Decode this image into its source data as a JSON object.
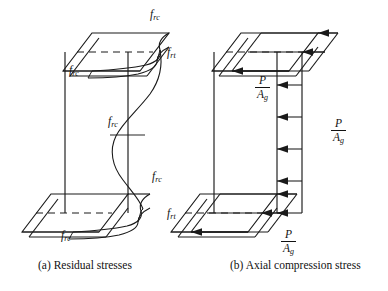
{
  "figure": {
    "background_color": "#ffffff",
    "ink_color": "#1a1a1a",
    "panels": [
      {
        "id": "a",
        "caption": "(a) Residual stresses",
        "caption_x": 38,
        "caption_y": 259,
        "description": "Isometric wide-flange I-section showing residual stress distribution with compression at flange tips and web center, tension at flange-web junctions",
        "labels": [
          {
            "name": "top-flange-tip-frc",
            "symbol": "f",
            "subscript": "rc",
            "x": 150,
            "y": 10
          },
          {
            "name": "top-flange-junction-frt",
            "symbol": "f",
            "subscript": "rt",
            "x": 167,
            "y": 48
          },
          {
            "name": "top-flange-inner-frc",
            "symbol": "f",
            "subscript": "rc",
            "x": 69,
            "y": 66
          },
          {
            "name": "web-mid-frc",
            "symbol": "f",
            "subscript": "rc",
            "x": 108,
            "y": 117
          },
          {
            "name": "bottom-flange-tip-frc",
            "symbol": "f",
            "subscript": "rc",
            "x": 152,
            "y": 172
          },
          {
            "name": "bottom-flange-junction-frt",
            "symbol": "f",
            "subscript": "rt",
            "x": 167,
            "y": 209
          },
          {
            "name": "bottom-flange-inner-frc",
            "symbol": "f",
            "subscript": "rc",
            "x": 61,
            "y": 231
          }
        ]
      },
      {
        "id": "b",
        "caption": "(b) Axial compression stress",
        "caption_x": 230,
        "caption_y": 259,
        "description": "Isometric wide-flange I-section showing uniform axial compression stress arrows of constant magnitude P over A g acting on flanges and web",
        "fractions": [
          {
            "name": "top-flange-stress",
            "numerator": "P",
            "denominator": "A",
            "denominator_subscript": "g",
            "x": 262,
            "y": 74
          },
          {
            "name": "web-stress",
            "numerator": "P",
            "denominator": "A",
            "denominator_subscript": "g",
            "x": 338,
            "y": 117
          },
          {
            "name": "bottom-flange-stress",
            "numerator": "P",
            "denominator": "A",
            "denominator_subscript": "g",
            "x": 288,
            "y": 228
          }
        ],
        "web_arrow_count": 5,
        "flange_arrow_count": 4
      }
    ]
  }
}
